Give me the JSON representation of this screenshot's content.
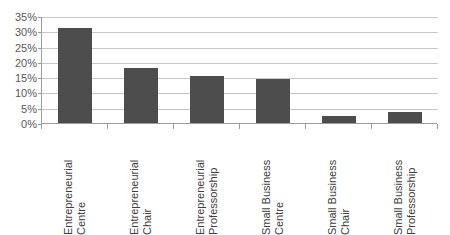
{
  "chart_data": {
    "type": "bar",
    "title": "",
    "subtitle": "",
    "xlabel": "",
    "ylabel": "",
    "categories": [
      "Entrepreneurial Centre",
      "Entrepreneurial Chair",
      "Entrepreneurial Professorship",
      "Small Business Centre",
      "Small Business Chair",
      "Small Business Professorship"
    ],
    "category_lines": [
      [
        "Entrepreneurial",
        "Centre"
      ],
      [
        "Entrepreneurial",
        "Chair"
      ],
      [
        "Entrepreneurial",
        "Professorship"
      ],
      [
        "Small Business",
        "Centre"
      ],
      [
        "Small Business",
        "Chair"
      ],
      [
        "Small Business",
        "Professorship"
      ]
    ],
    "values": [
      31,
      18,
      15.3,
      14.5,
      2.4,
      3.7
    ],
    "ylim": [
      0,
      35
    ],
    "ytick_labels": [
      "0%",
      "5%",
      "10%",
      "15%",
      "20%",
      "25%",
      "30%",
      "35%"
    ],
    "ytick_values": [
      0,
      5,
      10,
      15,
      20,
      25,
      30,
      35
    ],
    "grid": true,
    "legend": false,
    "legend_position": "none",
    "colors": {
      "bar": "#4d4d4d",
      "gridline": "#c8c8c8",
      "axis": "#9c9c9c",
      "tick_text": "#595959",
      "category_text": "#404040",
      "background": "#ffffff"
    }
  }
}
